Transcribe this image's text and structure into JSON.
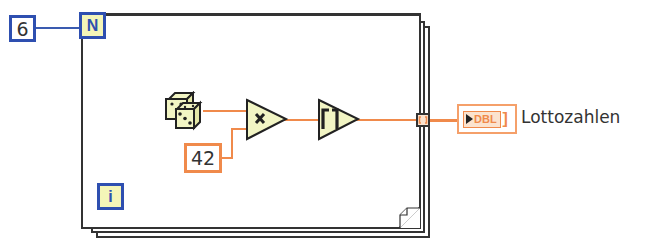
{
  "diagram": {
    "type": "LabVIEW block diagram",
    "loop": {
      "kind": "For Loop",
      "count_terminal_label": "N",
      "iteration_terminal_label": "i"
    },
    "count_constant": {
      "value": "6"
    },
    "random_node": {
      "icon": "dice-icon",
      "function": "Random Number (0-1)"
    },
    "multiplier_constant": {
      "value": "42"
    },
    "multiply_node": {
      "symbol": "×",
      "function": "Multiply"
    },
    "ceiling_node": {
      "symbol": "⌈⌉",
      "function": "Round Toward +Infinity"
    },
    "tunnel": {
      "kind": "auto-indexing output tunnel",
      "symbol": "[ ]"
    },
    "indicator": {
      "type_label": "DBL",
      "brackets": "[]",
      "name": "Lottozahlen"
    },
    "colors": {
      "integer_wire": "#3a5bb0",
      "double_wire": "#f08a4b",
      "loop_terminal_fill": "#f4f5b8",
      "node_fill": "#f2f5c4",
      "frame_border": "#333333"
    }
  }
}
